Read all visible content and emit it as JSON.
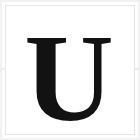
{
  "image": {
    "kind": "letter-tile",
    "width": 140,
    "height": 140,
    "description": "Serif capital letter U on white tile"
  },
  "tile": {
    "background_color": "#ffffff",
    "frame_color": "#e6e6e6",
    "edge_color": "#f2f2f2",
    "tick_color": "#ececec"
  },
  "glyph": {
    "character": "U",
    "name": "letter-u",
    "color": "#121212",
    "style": "serif-bold",
    "font_size_px": 124,
    "baseline_y": 120,
    "center_x": 69
  }
}
